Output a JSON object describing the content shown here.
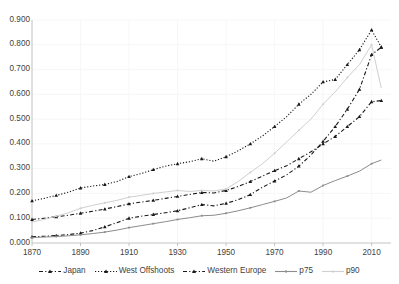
{
  "chart_data": {
    "type": "line",
    "title": "",
    "subtitle": "",
    "xlabel": "",
    "ylabel": "",
    "xlim": [
      1870,
      2018
    ],
    "ylim": [
      0.0,
      0.9
    ],
    "grid": "faint vertical and horizontal gridlines",
    "legend_position": "bottom",
    "ytick_labels": [
      "0.000",
      "0.100",
      "0.200",
      "0.300",
      "0.400",
      "0.500",
      "0.600",
      "0.700",
      "0.800",
      "0.900"
    ],
    "ytick_values": [
      0.0,
      0.1,
      0.2,
      0.3,
      0.4,
      0.5,
      0.6,
      0.7,
      0.8,
      0.9
    ],
    "xtick_labels": [
      "1870",
      "1890",
      "1910",
      "1930",
      "1950",
      "1970",
      "1990",
      "2010"
    ],
    "xtick_values": [
      1870,
      1890,
      1910,
      1930,
      1950,
      1970,
      1990,
      2010
    ],
    "series": [
      {
        "name": "Japan",
        "color": "#1a1a1a",
        "style": "dash-dot with triangle markers",
        "x": [
          1870,
          1875,
          1880,
          1885,
          1890,
          1895,
          1900,
          1905,
          1910,
          1915,
          1920,
          1925,
          1930,
          1935,
          1940,
          1945,
          1950,
          1955,
          1960,
          1965,
          1970,
          1975,
          1980,
          1985,
          1990,
          1995,
          2000,
          2005,
          2010,
          2014
        ],
        "values": [
          0.025,
          0.027,
          0.03,
          0.034,
          0.04,
          0.05,
          0.065,
          0.082,
          0.1,
          0.108,
          0.115,
          0.122,
          0.13,
          0.142,
          0.155,
          0.15,
          0.16,
          0.175,
          0.195,
          0.225,
          0.25,
          0.275,
          0.31,
          0.355,
          0.41,
          0.47,
          0.54,
          0.62,
          0.76,
          0.79
        ]
      },
      {
        "name": "West Offshoots",
        "color": "#1a1a1a",
        "style": "dotted with triangle markers",
        "x": [
          1870,
          1875,
          1880,
          1885,
          1890,
          1895,
          1900,
          1905,
          1910,
          1915,
          1920,
          1925,
          1930,
          1935,
          1940,
          1945,
          1950,
          1955,
          1960,
          1965,
          1970,
          1975,
          1980,
          1985,
          1990,
          1995,
          2000,
          2005,
          2010,
          2014
        ],
        "values": [
          0.17,
          0.18,
          0.192,
          0.205,
          0.222,
          0.23,
          0.236,
          0.248,
          0.268,
          0.28,
          0.296,
          0.31,
          0.32,
          0.328,
          0.34,
          0.33,
          0.348,
          0.372,
          0.4,
          0.432,
          0.47,
          0.51,
          0.56,
          0.6,
          0.65,
          0.66,
          0.72,
          0.78,
          0.86,
          0.79
        ]
      },
      {
        "name": "Western Europe",
        "color": "#1a1a1a",
        "style": "dash-dot with triangle markers",
        "x": [
          1870,
          1875,
          1880,
          1885,
          1890,
          1895,
          1900,
          1905,
          1910,
          1915,
          1920,
          1925,
          1930,
          1935,
          1940,
          1945,
          1950,
          1955,
          1960,
          1965,
          1970,
          1975,
          1980,
          1985,
          1990,
          1995,
          2000,
          2005,
          2010,
          2014
        ],
        "values": [
          0.095,
          0.1,
          0.106,
          0.112,
          0.12,
          0.128,
          0.137,
          0.147,
          0.158,
          0.165,
          0.172,
          0.18,
          0.188,
          0.196,
          0.204,
          0.202,
          0.212,
          0.228,
          0.248,
          0.27,
          0.292,
          0.312,
          0.34,
          0.368,
          0.4,
          0.43,
          0.47,
          0.51,
          0.57,
          0.575
        ]
      },
      {
        "name": "p75",
        "color": "#8c8c8c",
        "style": "solid with small square markers",
        "x": [
          1870,
          1875,
          1880,
          1885,
          1890,
          1895,
          1900,
          1905,
          1910,
          1915,
          1920,
          1925,
          1930,
          1935,
          1940,
          1945,
          1950,
          1955,
          1960,
          1965,
          1970,
          1975,
          1980,
          1985,
          1990,
          1995,
          2000,
          2005,
          2010,
          2014
        ],
        "values": [
          0.022,
          0.024,
          0.026,
          0.029,
          0.033,
          0.038,
          0.044,
          0.052,
          0.062,
          0.07,
          0.078,
          0.086,
          0.095,
          0.102,
          0.11,
          0.112,
          0.12,
          0.13,
          0.142,
          0.155,
          0.168,
          0.182,
          0.21,
          0.205,
          0.232,
          0.252,
          0.27,
          0.29,
          0.32,
          0.335
        ]
      },
      {
        "name": "p90",
        "color": "#cfcfcf",
        "style": "solid light gray with small markers",
        "x": [
          1870,
          1875,
          1880,
          1885,
          1890,
          1895,
          1900,
          1905,
          1910,
          1915,
          1920,
          1925,
          1930,
          1935,
          1940,
          1945,
          1950,
          1955,
          1960,
          1965,
          1970,
          1975,
          1980,
          1985,
          1990,
          1995,
          2000,
          2005,
          2010,
          2014
        ],
        "values": [
          0.085,
          0.095,
          0.108,
          0.122,
          0.14,
          0.152,
          0.162,
          0.172,
          0.185,
          0.192,
          0.2,
          0.206,
          0.212,
          0.208,
          0.212,
          0.21,
          0.218,
          0.248,
          0.285,
          0.32,
          0.362,
          0.408,
          0.455,
          0.5,
          0.56,
          0.61,
          0.668,
          0.72,
          0.8,
          0.625
        ]
      }
    ]
  },
  "legend": {
    "items": [
      {
        "label": "Japan",
        "color": "#1a1a1a"
      },
      {
        "label": "West Offshoots",
        "color": "#1a1a1a"
      },
      {
        "label": "Western Europe",
        "color": "#1a1a1a"
      },
      {
        "label": "p75",
        "color": "#8c8c8c"
      },
      {
        "label": "p90",
        "color": "#cfcfcf"
      }
    ]
  },
  "axis": {
    "y_labels": [
      "0.900",
      "0.800",
      "0.700",
      "0.600",
      "0.500",
      "0.400",
      "0.300",
      "0.200",
      "0.100",
      "0.000"
    ],
    "x_labels": [
      "1870",
      "1890",
      "1910",
      "1930",
      "1950",
      "1970",
      "1990",
      "2010"
    ]
  }
}
